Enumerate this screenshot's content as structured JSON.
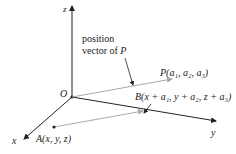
{
  "figure": {
    "axes": {
      "z_label": "z",
      "y_label": "y",
      "x_label": "x",
      "origin_label": "O"
    },
    "annotation": {
      "line1": "position",
      "line2_prefix": "vector of ",
      "line2_var": "P"
    },
    "points": {
      "P": {
        "name": "P",
        "coords": "(a₁, a₂, a₃)"
      },
      "A": {
        "name": "A",
        "coords": "(x, y, z)"
      },
      "B": {
        "name": "B",
        "coords": "(x + a₁, y + a₂, z + a₃)"
      }
    },
    "colors": {
      "axis": "#222222",
      "vector": "#a8a8a8",
      "text": "#222222"
    }
  }
}
